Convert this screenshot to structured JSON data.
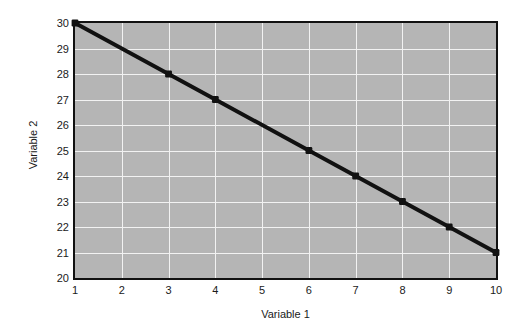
{
  "chart_data": {
    "type": "line",
    "title": "",
    "xlabel": "Variable 1",
    "ylabel": "Variable 2",
    "xlim": [
      1,
      10
    ],
    "ylim": [
      20,
      30
    ],
    "xticks": [
      1,
      2,
      3,
      4,
      5,
      6,
      7,
      8,
      9,
      10
    ],
    "yticks": [
      20,
      21,
      22,
      23,
      24,
      25,
      26,
      27,
      28,
      29,
      30
    ],
    "xtick_labels": [
      "1",
      "2",
      "3",
      "4",
      "5",
      "6",
      "7",
      "8",
      "9",
      "10"
    ],
    "ytick_labels": [
      "20",
      "21",
      "22",
      "23",
      "24",
      "25",
      "26",
      "27",
      "28",
      "29",
      "30"
    ],
    "grid": true,
    "legend": null,
    "series": [
      {
        "name": "Variable 2",
        "x": [
          1,
          3,
          4,
          6,
          7,
          8,
          9,
          10
        ],
        "values": [
          30,
          28,
          27,
          25,
          24,
          23,
          22,
          21
        ],
        "points": [
          {
            "x": 1,
            "y": 30
          },
          {
            "x": 3,
            "y": 28
          },
          {
            "x": 4,
            "y": 27
          },
          {
            "x": 6,
            "y": 25
          },
          {
            "x": 7,
            "y": 24
          },
          {
            "x": 8,
            "y": 23
          },
          {
            "x": 9,
            "y": 22
          },
          {
            "x": 10,
            "y": 21
          }
        ],
        "line_color": "#111111",
        "marker_color": "#111111",
        "marker": "square",
        "line_width": 4
      }
    ],
    "colors": {
      "plot_background": "#b5b5b5",
      "gridline": "#f2f2f2",
      "axis_border": "#111111",
      "text": "#1a1a1a",
      "figure_background": "#ffffff"
    }
  }
}
